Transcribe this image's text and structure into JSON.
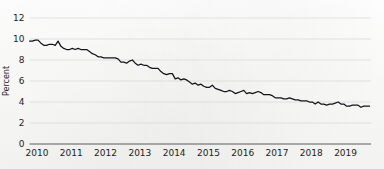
{
  "chart_data": {
    "type": "line",
    "title": "",
    "subtitle": "",
    "xlabel": "",
    "ylabel": "Percent",
    "xlim": [
      2010.0,
      2019.96
    ],
    "ylim": [
      0,
      12
    ],
    "ytick_values": [
      0,
      2,
      4,
      6,
      8,
      10,
      12
    ],
    "ytick_labels": [
      "0",
      "2",
      "4",
      "6",
      "8",
      "10",
      "12"
    ],
    "xtick_values": [
      2010,
      2011,
      2012,
      2013,
      2014,
      2015,
      2016,
      2017,
      2018,
      2019
    ],
    "xtick_labels": [
      "2010",
      "2011",
      "2012",
      "2013",
      "2014",
      "2015",
      "2016",
      "2017",
      "2018",
      "2019"
    ],
    "grid": "horizontal",
    "legend": "none",
    "line_color": "#15151a",
    "grid_color": "#d7d7d5",
    "axis_color": "#5a5a58",
    "background_color": "#fdfdfc",
    "annotations": [],
    "series": [
      {
        "name": "Unemployment rate",
        "x": [
          2010.0,
          2010.083,
          2010.167,
          2010.25,
          2010.333,
          2010.417,
          2010.5,
          2010.583,
          2010.667,
          2010.75,
          2010.833,
          2010.917,
          2011.0,
          2011.083,
          2011.167,
          2011.25,
          2011.333,
          2011.417,
          2011.5,
          2011.583,
          2011.667,
          2011.75,
          2011.833,
          2011.917,
          2012.0,
          2012.083,
          2012.167,
          2012.25,
          2012.333,
          2012.417,
          2012.5,
          2012.583,
          2012.667,
          2012.75,
          2012.833,
          2012.917,
          2013.0,
          2013.083,
          2013.167,
          2013.25,
          2013.333,
          2013.417,
          2013.5,
          2013.583,
          2013.667,
          2013.75,
          2013.833,
          2013.917,
          2014.0,
          2014.083,
          2014.167,
          2014.25,
          2014.333,
          2014.417,
          2014.5,
          2014.583,
          2014.667,
          2014.75,
          2014.833,
          2014.917,
          2015.0,
          2015.083,
          2015.167,
          2015.25,
          2015.333,
          2015.417,
          2015.5,
          2015.583,
          2015.667,
          2015.75,
          2015.833,
          2015.917,
          2016.0,
          2016.083,
          2016.167,
          2016.25,
          2016.333,
          2016.417,
          2016.5,
          2016.583,
          2016.667,
          2016.75,
          2016.833,
          2016.917,
          2017.0,
          2017.083,
          2017.167,
          2017.25,
          2017.333,
          2017.417,
          2017.5,
          2017.583,
          2017.667,
          2017.75,
          2017.833,
          2017.917,
          2018.0,
          2018.083,
          2018.167,
          2018.25,
          2018.333,
          2018.417,
          2018.5,
          2018.583,
          2018.667,
          2018.75,
          2018.833,
          2018.917,
          2019.0,
          2019.083,
          2019.167,
          2019.25,
          2019.333,
          2019.417,
          2019.5,
          2019.583,
          2019.667,
          2019.75,
          2019.833,
          2019.917
        ],
        "values": [
          9.8,
          9.8,
          9.9,
          9.9,
          9.6,
          9.4,
          9.4,
          9.5,
          9.5,
          9.4,
          9.8,
          9.3,
          9.1,
          9.0,
          9.0,
          9.1,
          9.0,
          9.1,
          9.0,
          9.0,
          9.0,
          8.8,
          8.6,
          8.5,
          8.3,
          8.3,
          8.2,
          8.2,
          8.2,
          8.2,
          8.2,
          8.1,
          7.8,
          7.8,
          7.7,
          7.9,
          8.0,
          7.7,
          7.5,
          7.6,
          7.5,
          7.5,
          7.3,
          7.2,
          7.2,
          7.2,
          6.9,
          6.7,
          6.6,
          6.7,
          6.7,
          6.2,
          6.3,
          6.1,
          6.2,
          6.1,
          5.9,
          5.7,
          5.8,
          5.6,
          5.7,
          5.5,
          5.4,
          5.4,
          5.6,
          5.3,
          5.2,
          5.1,
          5.0,
          5.0,
          5.1,
          5.0,
          4.8,
          4.9,
          5.0,
          5.1,
          4.8,
          4.9,
          4.8,
          4.9,
          5.0,
          4.9,
          4.7,
          4.7,
          4.7,
          4.6,
          4.4,
          4.4,
          4.4,
          4.3,
          4.3,
          4.4,
          4.3,
          4.2,
          4.2,
          4.1,
          4.1,
          4.1,
          4.0,
          4.0,
          3.8,
          4.0,
          3.8,
          3.8,
          3.7,
          3.8,
          3.8,
          3.9,
          4.0,
          3.8,
          3.8,
          3.6,
          3.6,
          3.7,
          3.7,
          3.7,
          3.5,
          3.6,
          3.6,
          3.6
        ]
      }
    ]
  }
}
